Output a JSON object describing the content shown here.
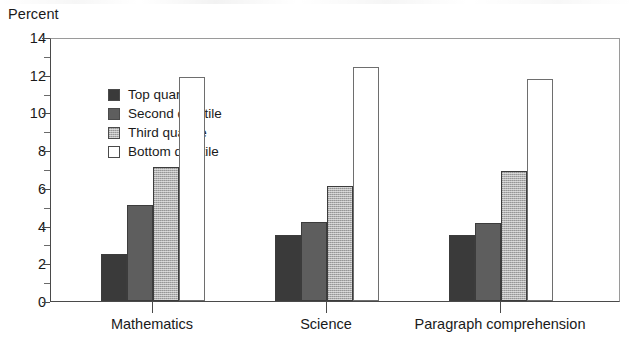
{
  "chart_data": {
    "type": "bar",
    "title": "",
    "xlabel": "",
    "ylabel": "Percent",
    "categories": [
      "Mathematics",
      "Science",
      "Paragraph comprehension"
    ],
    "series": [
      {
        "name": "Top quartile",
        "color": "#3a3a3a",
        "values": [
          2.5,
          3.5,
          3.5
        ]
      },
      {
        "name": "Second quartile",
        "color": "#5e5e5e",
        "values": [
          5.1,
          4.2,
          4.15
        ]
      },
      {
        "name": "Third quartile",
        "color": "#b0b0b0",
        "values": [
          7.1,
          6.1,
          6.9
        ]
      },
      {
        "name": "Bottom quartile",
        "color": "#ffffff",
        "values": [
          11.9,
          12.4,
          11.8
        ]
      }
    ],
    "ylim": [
      0,
      14
    ],
    "ytick_labels": [
      "0",
      "2",
      "4",
      "6",
      "8",
      "10",
      "12",
      "14"
    ],
    "ytick_values": [
      0,
      2,
      4,
      6,
      8,
      10,
      12,
      14
    ],
    "yminor_values": [
      1,
      3,
      5,
      7,
      9,
      11,
      13
    ],
    "grid": false,
    "legend_position": "upper left",
    "legend_entries": [
      "Top quartile",
      "Second quartile",
      "Third quartile",
      "Bottom quartile"
    ]
  }
}
